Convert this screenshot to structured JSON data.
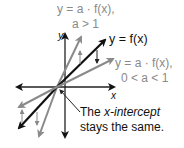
{
  "diagram": {
    "axes": {
      "x_label": "x",
      "y_label": "y"
    },
    "curves": [
      {
        "id": "stretch",
        "label_line1": "y = a · f(x),",
        "label_line2": "a > 1",
        "color": "#8a8a8a"
      },
      {
        "id": "original",
        "label_line1": "y = f(x)",
        "color": "#111111"
      },
      {
        "id": "shrink",
        "label_line1": "y = a · f(x),",
        "label_line2": "0 < a < 1",
        "color": "#8a8a8a"
      }
    ],
    "annotation": {
      "line1_prefix": "The ",
      "line1_italic": "x-intercept",
      "line2": "stays the same."
    },
    "colors": {
      "gray_line": "#8a8a8a",
      "black_line": "#111111",
      "background": "#ffffff"
    }
  }
}
